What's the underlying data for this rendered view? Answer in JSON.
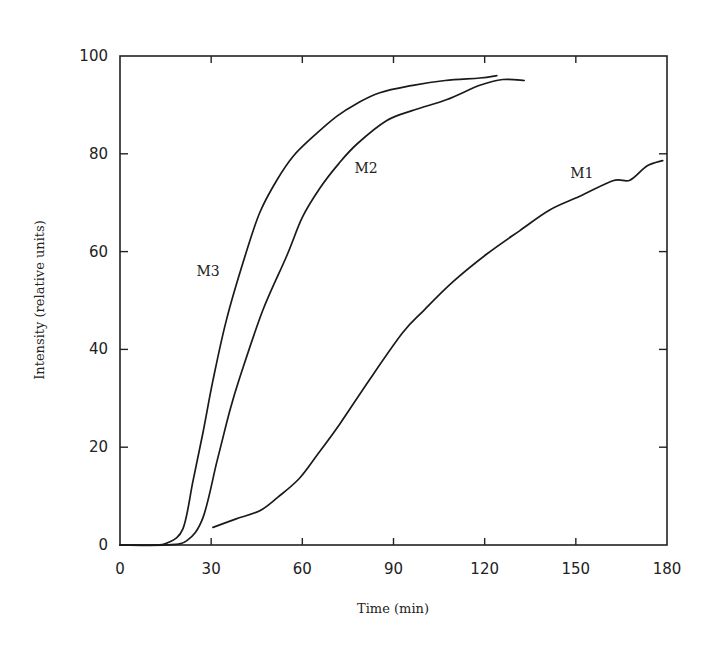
{
  "chart_data": {
    "type": "line",
    "title": "",
    "xlabel": "Time (min)",
    "ylabel": "Intensity (relative units)",
    "xlim": [
      0,
      180
    ],
    "ylim": [
      0,
      100
    ],
    "x_ticks": [
      0,
      30,
      60,
      90,
      120,
      150,
      180
    ],
    "y_ticks": [
      0,
      20,
      40,
      60,
      80,
      100
    ],
    "grid": false,
    "legend": "inline labels",
    "series": [
      {
        "name": "M3",
        "label_pos": [
          29,
          55
        ],
        "x": [
          0,
          10,
          15.5,
          20.7,
          24,
          27.3,
          30.6,
          35,
          41,
          46,
          51.6,
          57,
          63.5,
          71.4,
          78,
          85.5,
          96.4,
          107,
          118.4,
          124
        ],
        "y": [
          0,
          0,
          0.4,
          3.3,
          13,
          23,
          33.7,
          46,
          58.8,
          68,
          74.6,
          79.5,
          83.5,
          87.7,
          90.3,
          92.5,
          94,
          95,
          95.5,
          96
        ]
      },
      {
        "name": "M2",
        "label_pos": [
          81,
          76
        ],
        "x": [
          0,
          15,
          22,
          27.3,
          32,
          36.2,
          39.5,
          47,
          55,
          60,
          65.8,
          72,
          78,
          87.8,
          97,
          107.6,
          118.4,
          126,
          133
        ],
        "y": [
          0,
          0,
          0.9,
          5.6,
          17.3,
          27.6,
          34.4,
          48,
          59.3,
          67,
          73,
          78,
          82,
          86.8,
          89,
          91.1,
          94,
          95.2,
          95
        ]
      },
      {
        "name": "M1",
        "label_pos": [
          152,
          75
        ],
        "x": [
          30.6,
          38,
          46,
          52,
          59,
          65,
          72.4,
          82,
          93,
          100,
          109.5,
          120.7,
          131.6,
          141.4,
          151.3,
          162.2,
          167.8,
          173.4,
          178.6
        ],
        "y": [
          3.6,
          5.3,
          7,
          9.8,
          13.6,
          18.5,
          24.8,
          33.7,
          43.4,
          48,
          53.8,
          59.5,
          64.3,
          68.5,
          71.3,
          74.5,
          74.6,
          77.5,
          78.6
        ]
      }
    ]
  }
}
